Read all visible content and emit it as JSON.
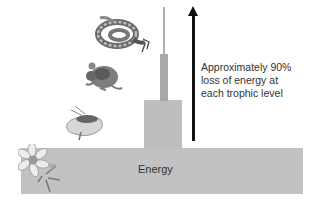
{
  "diagram": {
    "type": "energy-pyramid",
    "base_label": "Energy",
    "annotation_lines": [
      "Approximately 90%",
      "loss of energy at",
      "each trophic level"
    ],
    "arrow_direction": "up",
    "levels": [
      {
        "organism": "flower-plant",
        "role": "producer",
        "relative_width": 282
      },
      {
        "organism": "insect",
        "role": "primary consumer",
        "relative_width": 38
      },
      {
        "organism": "mouse",
        "role": "secondary consumer",
        "relative_width": 8
      },
      {
        "organism": "snake",
        "role": "tertiary consumer",
        "relative_width": 2
      }
    ],
    "colors": {
      "bar": "#c2c2c2",
      "arrow": "#111111",
      "text": "#333333"
    }
  }
}
